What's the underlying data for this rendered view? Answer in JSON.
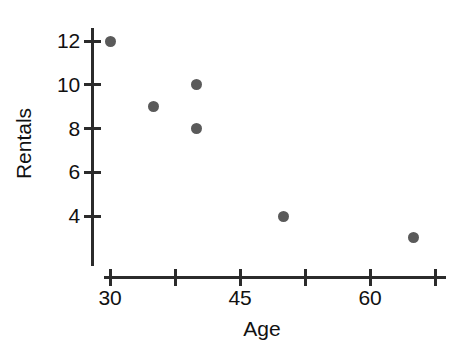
{
  "chart_data": {
    "type": "scatter",
    "title": "",
    "xlabel": "Age",
    "ylabel": "Rentals",
    "xlim": [
      30,
      67.5
    ],
    "ylim": [
      2,
      12.9
    ],
    "grid": false,
    "legend": null,
    "x_ticks": [
      {
        "value": 30,
        "label": "30"
      },
      {
        "value": 37.5,
        "label": ""
      },
      {
        "value": 45,
        "label": "45"
      },
      {
        "value": 52.5,
        "label": ""
      },
      {
        "value": 60,
        "label": "60"
      },
      {
        "value": 67.5,
        "label": ""
      }
    ],
    "y_ticks": [
      {
        "value": 12,
        "label": "12"
      },
      {
        "value": 10,
        "label": "10"
      },
      {
        "value": 8,
        "label": "8"
      },
      {
        "value": 6,
        "label": "6"
      },
      {
        "value": 4,
        "label": "4"
      }
    ],
    "x": [
      30,
      35,
      40,
      40,
      50,
      65
    ],
    "y": [
      12,
      9,
      10,
      8,
      4,
      3
    ],
    "points": [
      {
        "age": 30,
        "rentals": 12
      },
      {
        "age": 35,
        "rentals": 9
      },
      {
        "age": 40,
        "rentals": 10
      },
      {
        "age": 40,
        "rentals": 8
      },
      {
        "age": 50,
        "rentals": 4
      },
      {
        "age": 65,
        "rentals": 3
      }
    ],
    "marker": {
      "shape": "circle",
      "color": "#5a5a5a",
      "size_px": 11
    },
    "axis_color": "#2b2b2b",
    "background": "#ffffff"
  },
  "axes": {
    "x_title": "Age",
    "y_title": "Rentals"
  }
}
